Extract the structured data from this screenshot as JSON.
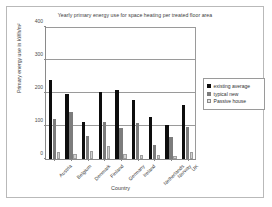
{
  "chart_data": {
    "type": "bar",
    "title": "Yearly primary energy use for space heating per treated floor area",
    "xlabel": "Country",
    "ylabel": "Primary energy use in kWh/m²",
    "categories": [
      "Austria",
      "Belgium",
      "Denmark",
      "Finland",
      "Germany",
      "Ireland",
      "Netherlands",
      "Norway",
      "UK"
    ],
    "series": [
      {
        "name": "existing average",
        "color": "#0d0d0d",
        "values": [
          240,
          198,
          112,
          202,
          210,
          180,
          128,
          103,
          165
        ]
      },
      {
        "name": "typical new",
        "color": "#7c7c7c",
        "values": [
          122,
          143,
          70,
          112,
          93,
          110,
          42,
          67,
          98
        ]
      },
      {
        "name": "Passive house",
        "color": "#d2d2d2",
        "values": [
          22,
          15,
          25,
          40,
          15,
          12,
          12,
          8,
          22
        ]
      }
    ],
    "ylim": [
      0,
      400
    ],
    "yticks": [
      0,
      100,
      200,
      300,
      400
    ],
    "ytick_labels": [
      "0",
      "100",
      "200",
      "300",
      "400"
    ],
    "grid": true,
    "legend_position": "right"
  },
  "legend": {
    "items": [
      {
        "label": "existing average"
      },
      {
        "label": "typical new"
      },
      {
        "label": "Passive house"
      }
    ]
  }
}
